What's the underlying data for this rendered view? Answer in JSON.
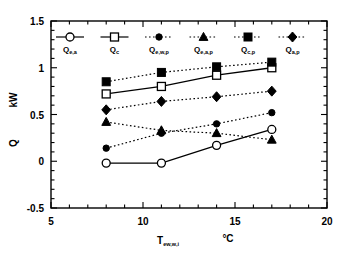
{
  "chart_data": {
    "type": "line",
    "title": "",
    "xlabel": "T_ew,w,i",
    "xunit": "°C",
    "ylabel": "Q",
    "yunit": "kW",
    "xlim": [
      5,
      20
    ],
    "ylim": [
      -0.5,
      1.5
    ],
    "xticks": [
      "5",
      "10",
      "15",
      "20"
    ],
    "xtick_values": [
      5,
      10,
      15,
      20
    ],
    "yticks": [
      "-0.5",
      "0",
      "0.5",
      "1",
      "1.5"
    ],
    "ytick_values": [
      -0.5,
      0,
      0.5,
      1,
      1.5
    ],
    "grid": false,
    "legend_position": "top-inside",
    "x": [
      8,
      11,
      14,
      17
    ],
    "series": [
      {
        "name": "Q_e,a",
        "label_base": "Q",
        "label_sub": "e,a",
        "marker": "open-circle",
        "line": "solid",
        "values": [
          -0.02,
          -0.02,
          0.17,
          0.34
        ]
      },
      {
        "name": "Q_c",
        "label_base": "Q",
        "label_sub": "c",
        "marker": "open-square",
        "line": "solid",
        "values": [
          0.72,
          0.8,
          0.92,
          1.0
        ]
      },
      {
        "name": "Q_e,w,p",
        "label_base": "Q",
        "label_sub": "e,w,p",
        "marker": "small-filled-circle",
        "line": "dotted",
        "values": [
          0.14,
          0.3,
          0.4,
          0.52
        ]
      },
      {
        "name": "Q_e,a,p",
        "label_base": "Q",
        "label_sub": "e,a,p",
        "marker": "filled-triangle",
        "line": "dotted",
        "values": [
          0.42,
          0.33,
          0.3,
          0.23
        ]
      },
      {
        "name": "Q_c,p",
        "label_base": "Q",
        "label_sub": "c,p",
        "marker": "filled-square",
        "line": "dotted",
        "values": [
          0.85,
          0.95,
          1.01,
          1.06
        ]
      },
      {
        "name": "Q_a,p",
        "label_base": "Q",
        "label_sub": "a,p",
        "marker": "filled-diamond",
        "line": "dotted",
        "values": [
          0.55,
          0.64,
          0.69,
          0.75
        ]
      }
    ]
  },
  "colors": {
    "axis": "#000000",
    "marker_fill": "#000000",
    "marker_open": "#ffffff",
    "background": "#ffffff"
  }
}
